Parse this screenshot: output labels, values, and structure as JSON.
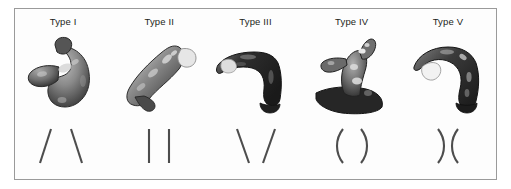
{
  "figure": {
    "frame_border_color": "#9a9a9a",
    "background_color": "#ffffff",
    "panel_background_color": "#fdfdfd",
    "label_color": "#231f20",
    "symbol_color": "#4d4d4d",
    "columns": [
      {
        "label": "Type I",
        "render_name": "aortic-arch-type-1-3d-model",
        "symbol_name": "type-1-diverging-lines-symbol",
        "symbol_description": "/ \\"
      },
      {
        "label": "Type II",
        "render_name": "aortic-arch-type-2-3d-model",
        "symbol_name": "type-2-parallel-lines-symbol",
        "symbol_description": "| |"
      },
      {
        "label": "Type III",
        "render_name": "aortic-arch-type-3-3d-model",
        "symbol_name": "type-3-converging-lines-symbol",
        "symbol_description": "\\ /"
      },
      {
        "label": "Type IV",
        "render_name": "aortic-arch-type-4-3d-model",
        "symbol_name": "type-4-outward-curves-symbol",
        "symbol_description": "( )"
      },
      {
        "label": "Type V",
        "render_name": "aortic-arch-type-5-3d-model",
        "symbol_name": "type-5-inward-curves-symbol",
        "symbol_description": ") ("
      }
    ]
  }
}
